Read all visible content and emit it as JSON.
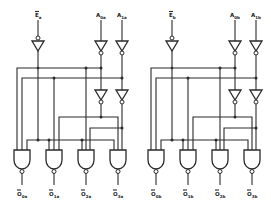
{
  "diagram": {
    "colors": {
      "line": "#2a2a2a",
      "background": "#ffffff"
    },
    "sections": [
      {
        "id": "a",
        "offset_x": 0,
        "enable": {
          "main": "E",
          "sub": "a",
          "overbar": true
        },
        "inputs": [
          {
            "main": "A",
            "sub": "0a"
          },
          {
            "main": "A",
            "sub": "1a"
          }
        ],
        "outputs": [
          {
            "main": "O",
            "sub": "0a",
            "overbar": true
          },
          {
            "main": "O",
            "sub": "1a",
            "overbar": true
          },
          {
            "main": "O",
            "sub": "2a",
            "overbar": true
          },
          {
            "main": "O",
            "sub": "3a",
            "overbar": true
          }
        ]
      },
      {
        "id": "b",
        "offset_x": 134,
        "enable": {
          "main": "E",
          "sub": "b",
          "overbar": true
        },
        "inputs": [
          {
            "main": "A",
            "sub": "0b"
          },
          {
            "main": "A",
            "sub": "1b"
          }
        ],
        "outputs": [
          {
            "main": "O",
            "sub": "0b",
            "overbar": true
          },
          {
            "main": "O",
            "sub": "1b",
            "overbar": true
          },
          {
            "main": "O",
            "sub": "2b",
            "overbar": true
          },
          {
            "main": "O",
            "sub": "3b",
            "overbar": true
          }
        ]
      }
    ],
    "components": {
      "input_inverters_per_section": 3,
      "second_stage_inverters_per_section": 2,
      "nand_gates_per_section": 4
    }
  }
}
